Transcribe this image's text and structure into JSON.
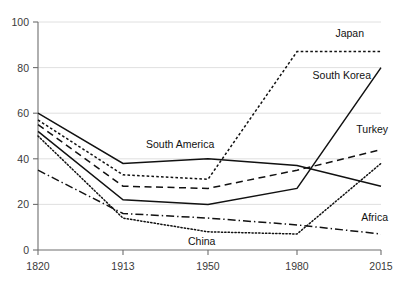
{
  "chart_data": {
    "type": "line",
    "title": "",
    "subtitle": "",
    "xlabel": "",
    "ylabel": "",
    "x": [
      1820,
      1913,
      1950,
      1980,
      2015
    ],
    "xtick_labels": [
      "1820",
      "1913",
      "1950",
      "1980",
      "2015"
    ],
    "ytick_labels": [
      "0",
      "20",
      "40",
      "60",
      "80",
      "100"
    ],
    "yticks": [
      0,
      20,
      40,
      60,
      80,
      100
    ],
    "ylim": [
      0,
      100
    ],
    "grid": "horizontal",
    "legend_position": "inline-right-labels",
    "series": [
      {
        "name": "Japan",
        "label": "Japan",
        "style": "dotted",
        "values": [
          57,
          33,
          31,
          87,
          87
        ]
      },
      {
        "name": "South Korea",
        "label": "South Korea",
        "style": "solid",
        "values": [
          52,
          22,
          20,
          27,
          80
        ]
      },
      {
        "name": "Turkey",
        "label": "Turkey",
        "style": "dashed",
        "values": [
          55,
          28,
          27,
          35,
          44
        ]
      },
      {
        "name": "South America",
        "label": "South America",
        "style": "solid",
        "values": [
          60,
          38,
          40,
          37,
          28
        ]
      },
      {
        "name": "China",
        "label": "China",
        "style": "dotted-fine",
        "values": [
          50,
          14,
          8,
          7,
          38
        ]
      },
      {
        "name": "Africa",
        "label": "Africa",
        "style": "dash-dot",
        "values": [
          35,
          16,
          14,
          11,
          7
        ]
      }
    ],
    "colors": {
      "line": "#111111",
      "grid": "#d8d8d8",
      "axis": "#6e6e6e",
      "tick_text": "#3a3a3a",
      "label_text": "#111111",
      "background": "#ffffff"
    }
  },
  "labels": {
    "japan": "Japan",
    "south_korea": "South Korea",
    "turkey": "Turkey",
    "south_america": "South America",
    "china": "China",
    "africa": "Africa"
  },
  "yticks": {
    "t0": "0",
    "t20": "20",
    "t40": "40",
    "t60": "60",
    "t80": "80",
    "t100": "100"
  },
  "xticks": {
    "t1820": "1820",
    "t1913": "1913",
    "t1950": "1950",
    "t1980": "1980",
    "t2015": "2015"
  }
}
